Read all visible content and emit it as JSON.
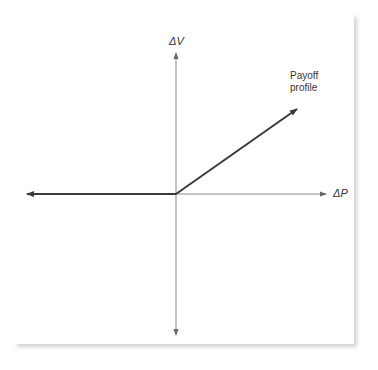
{
  "diagram": {
    "type": "payoff-diagram",
    "axes": {
      "x_label": "ΔP",
      "y_label": "ΔV"
    },
    "annotation": {
      "line1": "Payoff",
      "line2": "profile"
    },
    "colors": {
      "payoff_line": "#3a3a3a",
      "axis_line": "#8a8a8a",
      "text": "#333333"
    },
    "segments": [
      {
        "name": "flat-negative",
        "from": [
          -1,
          0
        ],
        "to": [
          0,
          0
        ]
      },
      {
        "name": "rising-positive",
        "from": [
          0,
          0
        ],
        "to": [
          1,
          0.7
        ]
      }
    ]
  }
}
